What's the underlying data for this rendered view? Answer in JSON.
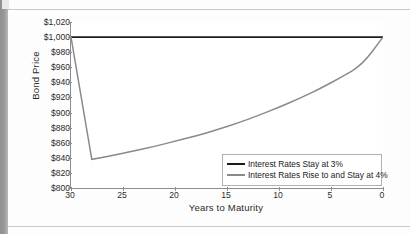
{
  "chart_data": {
    "type": "line",
    "title": "",
    "xlabel": "Years to Maturity",
    "ylabel": "Bond Price",
    "xlim": [
      30,
      0
    ],
    "ylim": [
      800,
      1020
    ],
    "x_reversed": true,
    "grid": false,
    "legend_position": "bottom-right",
    "y_ticks": [
      "$800",
      "$820",
      "$840",
      "$860",
      "$880",
      "$900",
      "$920",
      "$940",
      "$960",
      "$980",
      "$1,000",
      "$1,020"
    ],
    "y_tick_values": [
      800,
      820,
      840,
      860,
      880,
      900,
      920,
      940,
      960,
      980,
      1000,
      1020
    ],
    "x_ticks": [
      "30",
      "25",
      "20",
      "15",
      "10",
      "5",
      "0"
    ],
    "x_tick_values": [
      30,
      25,
      20,
      15,
      10,
      5,
      0
    ],
    "series": [
      {
        "name": "Interest Rates Stay at 3%",
        "color": "#1d1d1d",
        "width": 1.9,
        "x": [
          30,
          28,
          25,
          20,
          15,
          10,
          5,
          0
        ],
        "values": [
          1000,
          1000,
          1000,
          1000,
          1000,
          1000,
          1000,
          1000
        ]
      },
      {
        "name": "Interest Rates Rise to and Stay at 4%",
        "color": "#8a8a8a",
        "width": 1.5,
        "x": [
          30,
          28,
          26,
          24,
          22,
          20,
          18,
          16,
          14,
          12,
          10,
          8,
          6,
          4,
          2,
          0
        ],
        "values": [
          1000,
          838,
          843,
          849,
          855,
          862,
          869,
          877,
          886,
          896,
          907,
          919,
          932,
          947,
          963,
          1000
        ]
      }
    ]
  },
  "legend": {
    "items": [
      {
        "label": "Interest Rates Stay at 3%",
        "color": "#1d1d1d"
      },
      {
        "label": "Interest Rates Rise to and Stay at 4%",
        "color": "#8a8a8a"
      }
    ]
  }
}
